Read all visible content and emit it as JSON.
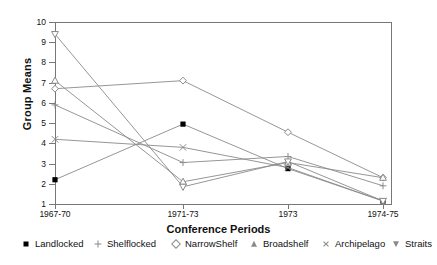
{
  "chart_data": {
    "type": "line",
    "title": "",
    "xlabel": "Conference Periods",
    "ylabel": "Group Means",
    "categories": [
      "1967-70",
      "1971-73",
      "1973",
      "1974-75"
    ],
    "ylim": [
      1,
      10
    ],
    "yticks": [
      1,
      2,
      3,
      4,
      5,
      6,
      7,
      8,
      9,
      10
    ],
    "ytick_labels": [
      "1",
      "2",
      "3",
      "4",
      "5",
      "6",
      "7",
      "8",
      "9",
      "10"
    ],
    "grid": false,
    "legend_position": "bottom",
    "series": [
      {
        "name": "Landlocked",
        "marker": "filled-square",
        "values": [
          2.2,
          4.95,
          2.75,
          1.15
        ]
      },
      {
        "name": "Shelflocked",
        "marker": "plus",
        "values": [
          5.9,
          3.05,
          3.35,
          1.9
        ]
      },
      {
        "name": "NarrowShelf",
        "marker": "diamond",
        "values": [
          6.7,
          7.1,
          4.55,
          2.3
        ]
      },
      {
        "name": "Broadshelf",
        "marker": "triangle-up",
        "values": [
          7.1,
          2.1,
          3.05,
          2.3
        ]
      },
      {
        "name": "Archipelago",
        "marker": "x-cross",
        "values": [
          4.2,
          3.8,
          2.8,
          1.15
        ]
      },
      {
        "name": "Straits",
        "marker": "triangle-down",
        "values": [
          9.4,
          1.85,
          3.1,
          1.15
        ]
      }
    ]
  },
  "axis": {
    "y_title": "Group Means",
    "x_title": "Conference Periods"
  },
  "legend": {
    "items": [
      {
        "label": "Landlocked",
        "marker": "filled-square-icon"
      },
      {
        "label": "Shelflocked",
        "marker": "plus-icon"
      },
      {
        "label": "NarrowShelf",
        "marker": "diamond-icon"
      },
      {
        "label": "Broadshelf",
        "marker": "triangle-up-icon"
      },
      {
        "label": "Archipelago",
        "marker": "x-cross-icon"
      },
      {
        "label": "Straits",
        "marker": "triangle-down-icon"
      }
    ]
  }
}
